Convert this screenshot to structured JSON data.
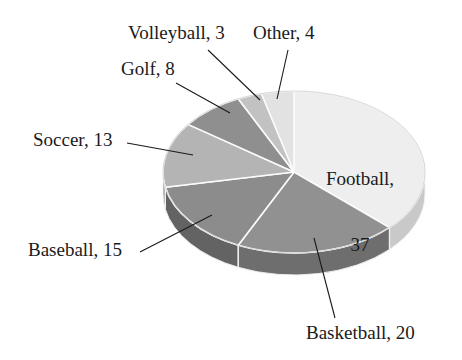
{
  "figure": {
    "background_color": "#ffffff",
    "text_color": "#1a1a1a",
    "leader_line_color": "#1a1a1a"
  },
  "chart_data": {
    "type": "pie",
    "title": "",
    "subtitle": "",
    "xlabel": "",
    "ylabel": "",
    "legend_position": "none",
    "grid": false,
    "label_format": "name, value",
    "total": 100,
    "start_angle_deg": 0,
    "direction": "clockwise",
    "three_d": true,
    "categories": [
      "Football",
      "Basketball",
      "Baseball",
      "Soccer",
      "Golf",
      "Volleyball",
      "Other"
    ],
    "values": [
      37,
      20,
      15,
      13,
      8,
      3,
      4
    ],
    "slices": [
      {
        "name": "Football",
        "value": 37,
        "label": "Football,\n37",
        "color": "#eeeeee",
        "side_color": "#c9c9c9",
        "label_placement": "inside"
      },
      {
        "name": "Basketball",
        "value": 20,
        "label": "Basketball, 20",
        "color": "#919191",
        "side_color": "#6e6e6e",
        "label_placement": "outside"
      },
      {
        "name": "Baseball",
        "value": 15,
        "label": "Baseball, 15",
        "color": "#8c8c8c",
        "side_color": "#636363",
        "label_placement": "outside"
      },
      {
        "name": "Soccer",
        "value": 13,
        "label": "Soccer, 13",
        "color": "#b4b4b4",
        "side_color": "#8a8a8a",
        "label_placement": "outside"
      },
      {
        "name": "Golf",
        "value": 8,
        "label": "Golf, 8",
        "color": "#8f8f8f",
        "side_color": "#6b6b6b",
        "label_placement": "outside"
      },
      {
        "name": "Volleyball",
        "value": 3,
        "label": "Volleyball, 3",
        "color": "#c2c2c2",
        "side_color": "#9a9a9a",
        "label_placement": "outside"
      },
      {
        "name": "Other",
        "value": 4,
        "label": "Other, 4",
        "color": "#e2e2e2",
        "side_color": "#b8b8b8",
        "label_placement": "outside"
      }
    ]
  },
  "labels": {
    "football": "Football,",
    "football_value": "37",
    "basketball": "Basketball, 20",
    "baseball": "Baseball, 15",
    "soccer": "Soccer, 13",
    "golf": "Golf, 8",
    "volleyball": "Volleyball, 3",
    "other": "Other, 4"
  }
}
